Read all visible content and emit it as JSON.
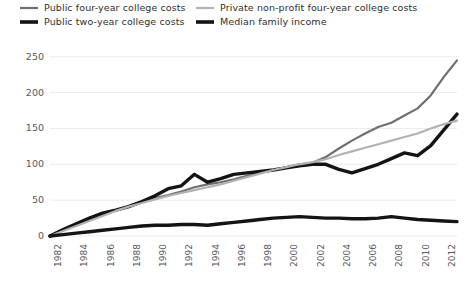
{
  "legend": {
    "items": [
      {
        "label": "Public four-year college costs",
        "color": "#6f6f6f",
        "width": 2.2,
        "key": "public_four_year"
      },
      {
        "label": "Public two-year college costs",
        "color": "#141414",
        "width": 3.4,
        "key": "public_two_year"
      },
      {
        "label": "Private non-profit four-year college costs",
        "color": "#b2b2b2",
        "width": 2.2,
        "key": "private_four_year"
      },
      {
        "label": "Median family income",
        "color": "#141414",
        "width": 3.4,
        "key": "median_family_income"
      }
    ]
  },
  "axes": {
    "y_ticks": [
      "0",
      "50",
      "100",
      "150",
      "200",
      "250"
    ],
    "x_ticks": [
      "1982",
      "1984",
      "1986",
      "1988",
      "1990",
      "1992",
      "1994",
      "1996",
      "1998",
      "2000",
      "2002",
      "2004",
      "2006",
      "2008",
      "2010",
      "2012"
    ]
  },
  "colors": {
    "gridline": "#ececec",
    "axis_text": "#55585c",
    "legend_text": "#2f2f2f",
    "background": "#ffffff"
  },
  "chart_data": {
    "type": "line",
    "title": "",
    "subtitle": "",
    "xlabel": "",
    "ylabel": "",
    "xlim": [
      1982,
      2013
    ],
    "ylim": [
      0,
      265
    ],
    "grid": true,
    "grid_axis": "y",
    "legend_position": "top",
    "x": [
      1982,
      1983,
      1984,
      1985,
      1986,
      1987,
      1988,
      1989,
      1990,
      1991,
      1992,
      1993,
      1994,
      1995,
      1996,
      1997,
      1998,
      1999,
      2000,
      2001,
      2002,
      2003,
      2004,
      2005,
      2006,
      2007,
      2008,
      2009,
      2010,
      2011,
      2012,
      2013
    ],
    "series": [
      {
        "name": "Public four-year college costs",
        "color": "#6f6f6f",
        "values": [
          0,
          8,
          16,
          23,
          30,
          36,
          42,
          48,
          53,
          57,
          62,
          68,
          72,
          75,
          79,
          84,
          88,
          92,
          96,
          100,
          102,
          110,
          122,
          133,
          143,
          152,
          158,
          168,
          178,
          196,
          222,
          245
        ]
      },
      {
        "name": "Public two-year college costs",
        "color": "#141414",
        "values": [
          0,
          9,
          17,
          25,
          32,
          36,
          41,
          48,
          56,
          66,
          70,
          86,
          75,
          80,
          86,
          88,
          90,
          92,
          95,
          98,
          100,
          100,
          93,
          88,
          94,
          100,
          108,
          116,
          112,
          126,
          148,
          170
        ]
      },
      {
        "name": "Private non-profit four-year college costs",
        "color": "#b2b2b2",
        "values": [
          0,
          7,
          14,
          21,
          28,
          35,
          41,
          46,
          51,
          56,
          60,
          64,
          68,
          72,
          77,
          82,
          87,
          92,
          96,
          100,
          103,
          107,
          113,
          118,
          123,
          128,
          133,
          138,
          143,
          150,
          156,
          161
        ]
      },
      {
        "name": "Median family income",
        "color": "#141414",
        "values": [
          0,
          2,
          4,
          6,
          8,
          10,
          12,
          14,
          15,
          15,
          16,
          16,
          15,
          17,
          19,
          21,
          23,
          25,
          26,
          27,
          26,
          25,
          25,
          24,
          24,
          25,
          27,
          25,
          23,
          22,
          21,
          20
        ]
      }
    ]
  }
}
